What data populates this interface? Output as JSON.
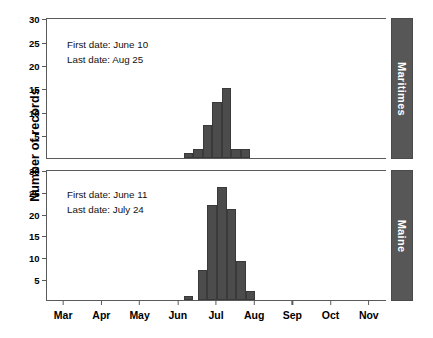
{
  "chart_data": {
    "type": "bar",
    "title": "",
    "subtitle": "",
    "xlabel": "",
    "ylabel": "Number of records",
    "ylim": [
      0,
      30
    ],
    "yticks": [
      5,
      10,
      15,
      20,
      25,
      30
    ],
    "xticks": [
      "Mar",
      "Apr",
      "May",
      "Jun",
      "Jul",
      "Aug",
      "Sep",
      "Oct",
      "Nov"
    ],
    "xlim_months": [
      3,
      11
    ],
    "grid": false,
    "legend": "none",
    "layout": "two stacked facet panels, strip labels on right edge",
    "bar_color": "#4c4c4c",
    "bar_edge_color": "#3a3a3a",
    "strip_color": "#575757",
    "strip_text_color": "#ffffff",
    "axis_color": "#5a5a5a",
    "panels": [
      {
        "strip_label": "Maritimes",
        "annotations": [
          "First date: June 10",
          "Last date: Aug 25"
        ],
        "first_date": "June 10",
        "last_date": "Aug 25",
        "bin_width_months": 0.25,
        "bars": [
          {
            "x_month": 6.25,
            "value": 1
          },
          {
            "x_month": 6.5,
            "value": 2
          },
          {
            "x_month": 6.75,
            "value": 7
          },
          {
            "x_month": 7.0,
            "value": 12
          },
          {
            "x_month": 7.25,
            "value": 15
          },
          {
            "x_month": 7.5,
            "value": 2
          },
          {
            "x_month": 7.75,
            "value": 2
          }
        ],
        "values": [
          1,
          2,
          7,
          12,
          15,
          2,
          2
        ],
        "peak_value": 15,
        "total_records": 41
      },
      {
        "strip_label": "Maine",
        "annotations": [
          "First date: June 11",
          "Last date: July 24"
        ],
        "first_date": "June 11",
        "last_date": "July 24",
        "bin_width_months": 0.25,
        "bars": [
          {
            "x_month": 6.25,
            "value": 1
          },
          {
            "x_month": 6.625,
            "value": 7
          },
          {
            "x_month": 6.875,
            "value": 22
          },
          {
            "x_month": 7.125,
            "value": 26
          },
          {
            "x_month": 7.375,
            "value": 21
          },
          {
            "x_month": 7.625,
            "value": 9
          },
          {
            "x_month": 7.875,
            "value": 2
          }
        ],
        "values": [
          1,
          7,
          22,
          26,
          21,
          9,
          2
        ],
        "peak_value": 26,
        "total_records": 88
      }
    ]
  }
}
